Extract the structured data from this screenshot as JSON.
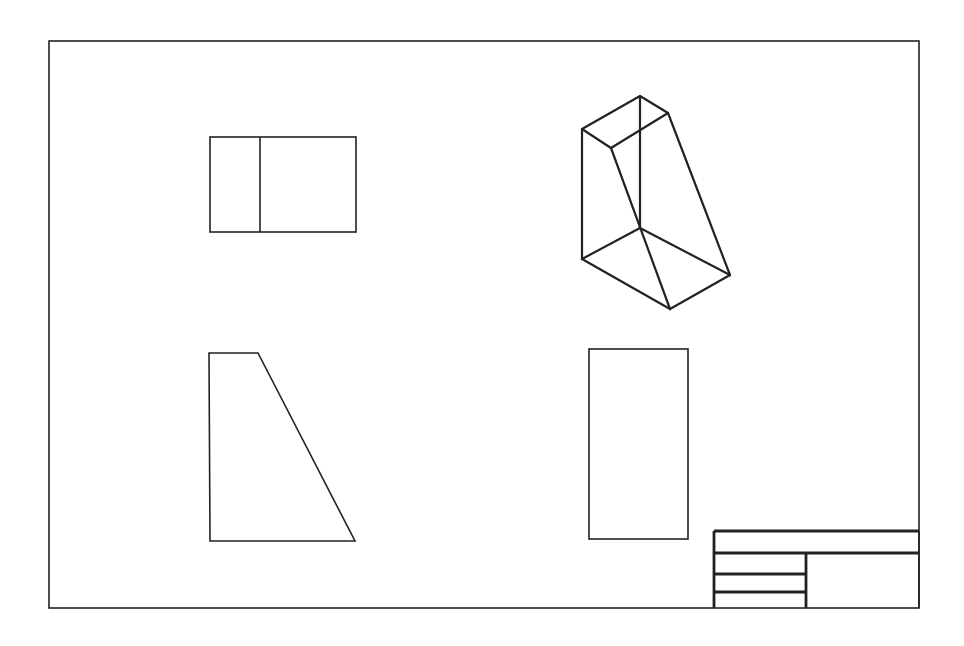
{
  "drawing": {
    "type": "orthographic-projection-sheet",
    "line_color": "#222222",
    "background": "#ffffff",
    "border": {
      "x": 49,
      "y": 41,
      "width": 870,
      "height": 567
    },
    "views": {
      "top_view": {
        "label": "",
        "rect": {
          "x": 210,
          "y": 137,
          "width": 146,
          "height": 95
        },
        "divider_x": 260
      },
      "isometric_view": {
        "label": "",
        "vertices": {
          "top_back": [
            640,
            96
          ],
          "top_left": [
            582,
            129
          ],
          "top_right": [
            668,
            113
          ],
          "top_front": [
            611,
            148
          ],
          "bottom_back": [
            640,
            228
          ],
          "bottom_left": [
            582,
            259
          ],
          "bottom_right": [
            730,
            275
          ],
          "bottom_front": [
            670,
            309
          ]
        }
      },
      "front_view": {
        "label": "",
        "points": [
          [
            209,
            353
          ],
          [
            258,
            353
          ],
          [
            355,
            541
          ],
          [
            210,
            541
          ]
        ]
      },
      "side_view": {
        "label": "",
        "rect": {
          "x": 589,
          "y": 349,
          "width": 99,
          "height": 190
        }
      }
    },
    "title_block": {
      "x": 714,
      "y": 531,
      "width": 205,
      "height": 77,
      "rows_y": [
        553,
        574,
        592
      ],
      "divider_x": 806,
      "cells": [
        "",
        "",
        "",
        "",
        ""
      ]
    }
  }
}
